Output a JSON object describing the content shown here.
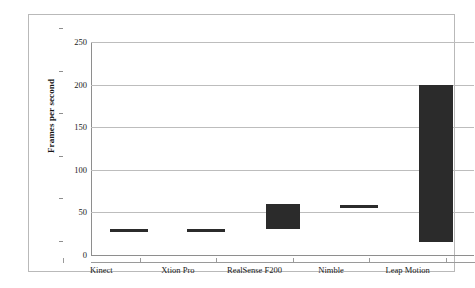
{
  "chart_data": {
    "type": "bar",
    "bar_style": "floating-range",
    "title": "",
    "xlabel": "",
    "ylabel": "Frames per second",
    "ylim": [
      0,
      250
    ],
    "ytick_step": 50,
    "yticks": [
      0,
      50,
      100,
      150,
      200,
      250
    ],
    "ytick_labels": [
      "0",
      "50",
      "100",
      "150",
      "200",
      "250"
    ],
    "grid": true,
    "legend": false,
    "categories": [
      "Kinect",
      "Xtion Pro",
      "RealSense F200",
      "Nimble",
      "Leap Motion"
    ],
    "low": [
      28,
      28,
      30,
      56,
      15
    ],
    "high": [
      30,
      30,
      60,
      58,
      200
    ],
    "series": [
      {
        "name": "Frame rate range",
        "color": "#2b2b2b",
        "points": [
          {
            "category": "Kinect",
            "low": 28,
            "high": 30
          },
          {
            "category": "Xtion Pro",
            "low": 28,
            "high": 30
          },
          {
            "category": "RealSense F200",
            "low": 30,
            "high": 60
          },
          {
            "category": "Nimble",
            "low": 56,
            "high": 58
          },
          {
            "category": "Leap Motion",
            "low": 15,
            "high": 200
          }
        ]
      }
    ]
  },
  "axes": {
    "y_title": "Frames per second"
  },
  "colors": {
    "bar": "#2b2b2b",
    "grid": "#bdbdbd",
    "axis": "#8e8e8e",
    "frame": "#b9b9b9",
    "background": "#ffffff"
  }
}
